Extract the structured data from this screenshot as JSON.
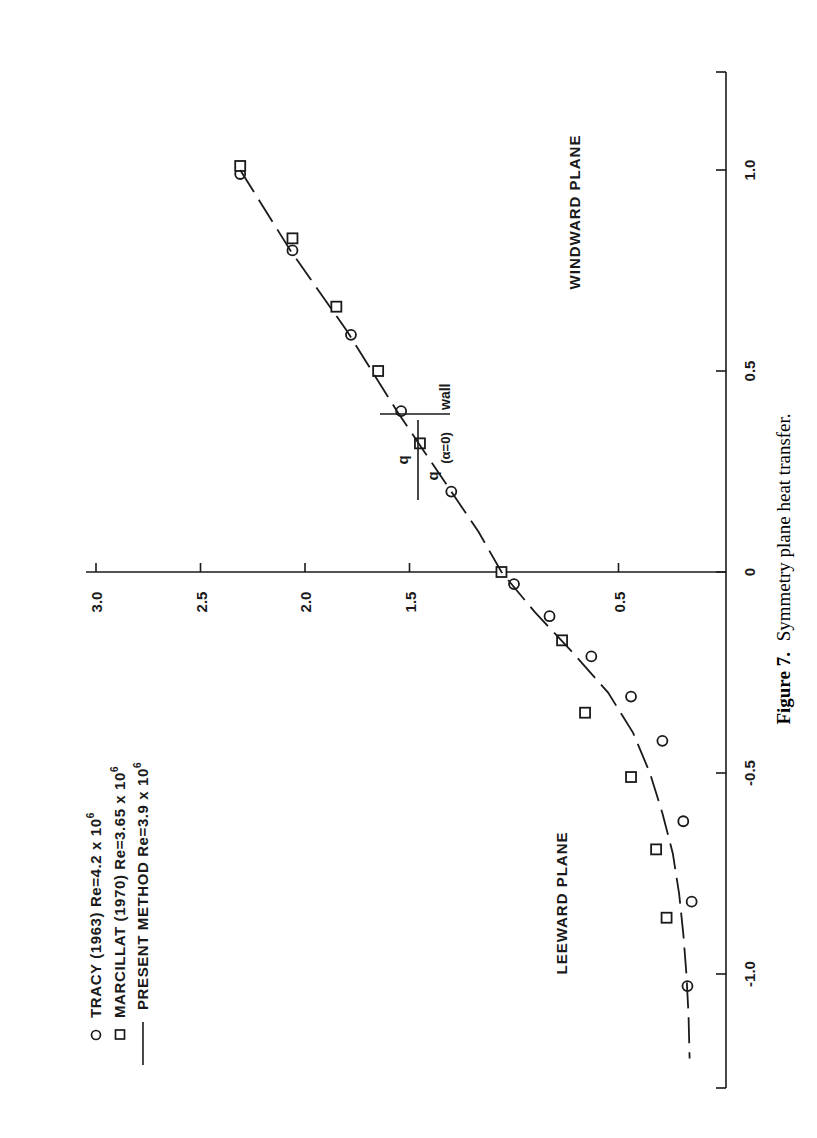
{
  "figure": {
    "caption_label": "Figure 7.",
    "caption_text": "Symmetry plane heat transfer.",
    "orientation": "rotated 90° counter-clockwise on page"
  },
  "chart_data": {
    "type": "scatter",
    "title": "Symmetry plane heat transfer",
    "xlabel": "",
    "ylabel": "q / q(α=0) |wall",
    "ylabel_parts": {
      "numerator": "q",
      "denominator": "q",
      "subscript": "(α=0)",
      "suffix": "wall"
    },
    "xlim": [
      -1.3,
      1.25
    ],
    "ylim": [
      0,
      3.0
    ],
    "x_ticks": [
      -1.0,
      -0.5,
      0,
      0.5,
      1.0
    ],
    "x_tick_labels": [
      "-1.0",
      "-0.5",
      "0",
      "0.5",
      "1.0"
    ],
    "y_ticks": [
      3.0,
      2.5,
      2.0,
      1.5,
      0.5
    ],
    "y_tick_labels": [
      "3.0",
      "2.5",
      "2.0",
      "1.5",
      "0.5"
    ],
    "grid": false,
    "legend_position": "upper-left (page bottom-left)",
    "annotations": [
      {
        "text": "WINDWARD PLANE",
        "x": 0.7,
        "y": 0.35
      },
      {
        "text": "LEEWARD PLANE",
        "x": -0.82,
        "y": 0.42
      }
    ],
    "series": [
      {
        "name": "TRACY (1963) Re=4.2 x 10^6",
        "legend_label": "TRACY (1963) Re=4.2 x 10",
        "exponent": "6",
        "marker": "circle",
        "points": [
          [
            0.99,
            2.31
          ],
          [
            0.8,
            2.06
          ],
          [
            0.59,
            1.78
          ],
          [
            0.4,
            1.54
          ],
          [
            0.2,
            1.3
          ],
          [
            -0.03,
            1.0
          ],
          [
            -0.11,
            0.83
          ],
          [
            -0.21,
            0.63
          ],
          [
            -0.31,
            0.44
          ],
          [
            -0.42,
            0.29
          ],
          [
            -0.62,
            0.19
          ],
          [
            -0.82,
            0.15
          ],
          [
            -1.03,
            0.17
          ]
        ]
      },
      {
        "name": "MARCILLAT (1970) Re=3.65 x 10^6",
        "legend_label": "MARCILLAT (1970)  Re=3.65 x 10",
        "exponent": "6",
        "marker": "square",
        "points": [
          [
            1.01,
            2.31
          ],
          [
            0.83,
            2.06
          ],
          [
            0.66,
            1.85
          ],
          [
            0.5,
            1.65
          ],
          [
            0.32,
            1.45
          ],
          [
            0.0,
            1.06
          ],
          [
            -0.17,
            0.77
          ],
          [
            -0.35,
            0.66
          ],
          [
            -0.51,
            0.44
          ],
          [
            -0.69,
            0.32
          ],
          [
            -0.86,
            0.27
          ]
        ]
      },
      {
        "name": "PRESENT METHOD Re=3.9 x 10^6",
        "legend_label": "PRESENT METHOD  Re=3.9 x 10",
        "exponent": "6",
        "marker": "dashed-line",
        "points": [
          [
            1.0,
            2.31
          ],
          [
            0.8,
            2.07
          ],
          [
            0.6,
            1.8
          ],
          [
            0.4,
            1.56
          ],
          [
            0.3,
            1.43
          ],
          [
            0.2,
            1.3
          ],
          [
            0.1,
            1.17
          ],
          [
            0.0,
            1.06
          ],
          [
            -0.1,
            0.9
          ],
          [
            -0.2,
            0.72
          ],
          [
            -0.3,
            0.55
          ],
          [
            -0.4,
            0.43
          ],
          [
            -0.5,
            0.35
          ],
          [
            -0.6,
            0.29
          ],
          [
            -0.7,
            0.24
          ],
          [
            -0.8,
            0.21
          ],
          [
            -0.9,
            0.19
          ],
          [
            -1.0,
            0.175
          ],
          [
            -1.1,
            0.165
          ],
          [
            -1.21,
            0.16
          ]
        ]
      }
    ]
  }
}
